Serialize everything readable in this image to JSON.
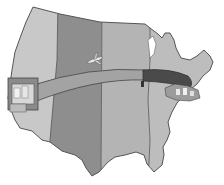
{
  "illustration": {
    "subject": "Map of the continental United States with a band stretching from west coast to east coast",
    "zones": [
      {
        "name": "pacific",
        "color": "#c8c8c8"
      },
      {
        "name": "mountain",
        "color": "#8e8e8e"
      },
      {
        "name": "central",
        "color": "#b4b4b4"
      },
      {
        "name": "eastern",
        "color": "#bdbdbd"
      }
    ],
    "band": {
      "light_color": "#9a9a9a",
      "dark_color": "#4a4a4a"
    },
    "outline_color": "#555555",
    "objects": [
      "airplane",
      "west-coast-city",
      "east-coast-city"
    ]
  }
}
